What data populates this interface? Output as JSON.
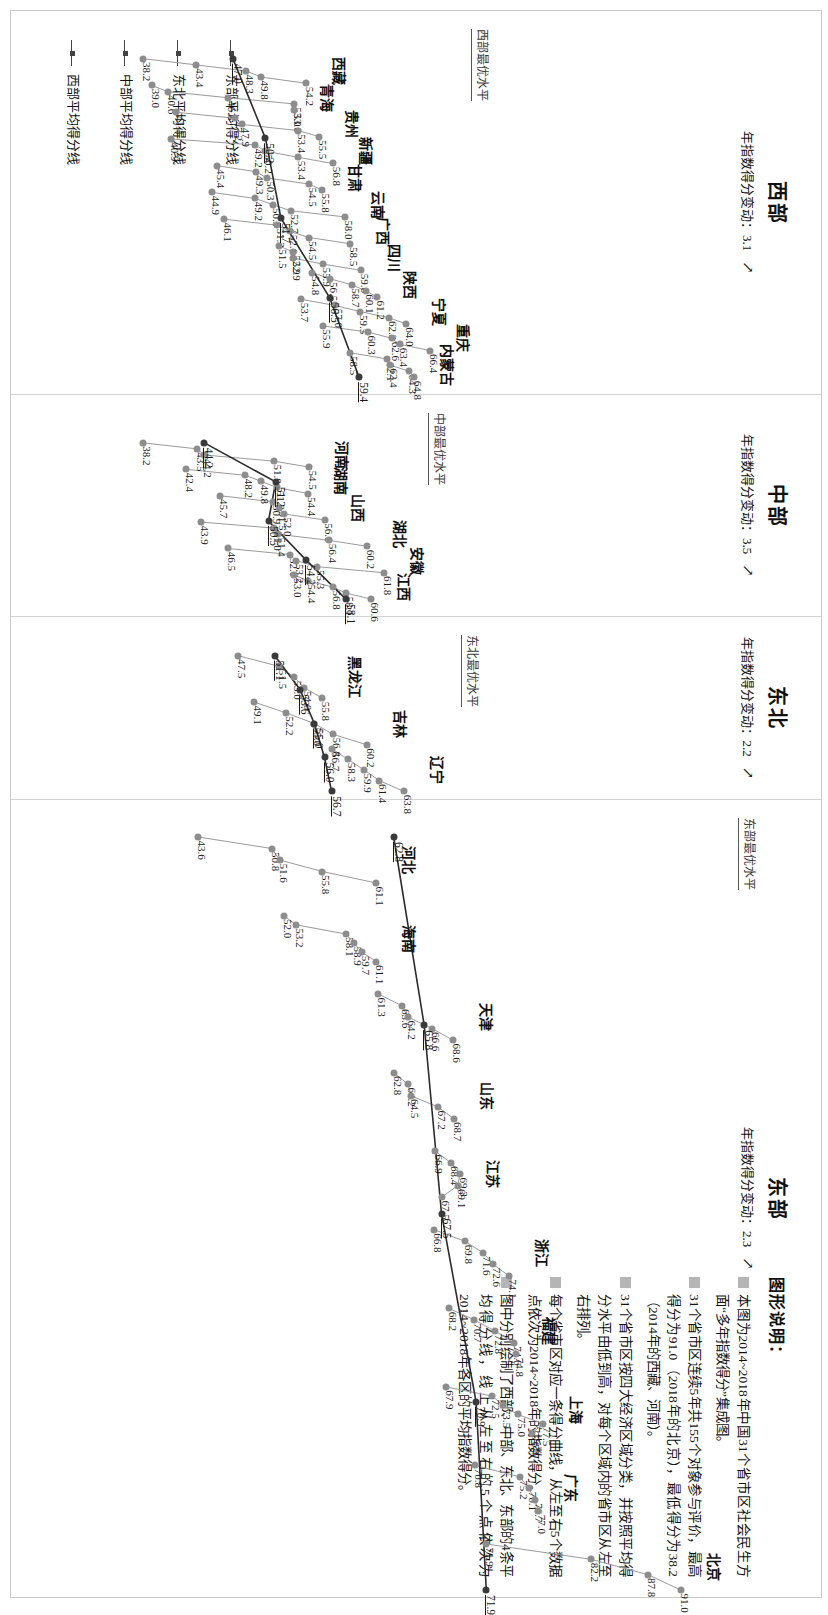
{
  "figure": {
    "orientation": "rotated-90",
    "avg_line_legend": [
      {
        "label": "东部平均得分线"
      },
      {
        "label": "东北平均得分线"
      },
      {
        "label": "中部平均得分线"
      },
      {
        "label": "西部平均得分线"
      }
    ],
    "explanation": {
      "title": "图形说明：",
      "items": [
        "本图为2014~2018年中国31个省市区社会民生方面“多年指数得分”集成图。",
        "31个省市区连续5年共155个对象参与评价，最高得分为91.0（2018年的北京），最低得分为38.2（2014年的西藏、河南）。",
        "31个省市区按四大经济区域分类，并按照平均得分水平由低到高，对每个区域内的省市区从左至右排列。",
        "每个省市区对应一条得分曲线，从左至右5个数据点依次为2014~2018年的指数得分。",
        "图中分别绘制了西部、中部、东北、东部的4条平均得分线，线上从左至右的5个点依次为2014~2018年各区的平均指数得分。"
      ]
    }
  },
  "chart_data": {
    "type": "line",
    "xlabel": "",
    "ylabel": "指数得分",
    "ylim": [
      38,
      92
    ],
    "x": [
      "2014",
      "2015",
      "2016",
      "2017",
      "2018"
    ],
    "grid": false,
    "legend_position": "bottom-left",
    "regions": [
      {
        "name": "西部",
        "annual_change_label": "年指数得分变动：3.1",
        "annual_change": 3.1,
        "best_level_label": "西部最优水平",
        "avg_label": "西部平均得分线",
        "avg_values": [
          47.0,
          50.2,
          51.7,
          56.5,
          59.4
        ],
        "series": [
          {
            "name": "西藏",
            "values": [
              38.2,
              43.4,
              48.3,
              49.8,
              54.2
            ]
          },
          {
            "name": "青海",
            "values": [
              39.0,
              40.6,
              46.5,
              53.0,
              53.0
            ]
          },
          {
            "name": "贵州",
            "values": [
              41.4,
              47.2,
              47.9,
              53.4,
              55.5
            ]
          },
          {
            "name": "新疆",
            "values": [
              40.9,
              49.2,
              50.2,
              53.4,
              56.8
            ]
          },
          {
            "name": "甘肃",
            "values": [
              45.4,
              49.3,
              50.3,
              54.5,
              55.8
            ]
          },
          {
            "name": "云南",
            "values": [
              44.9,
              49.2,
              50.9,
              52.7,
              58.0
            ]
          },
          {
            "name": "广西",
            "values": [
              46.1,
              51.3,
              52.6,
              54.5,
              58.5
            ]
          },
          {
            "name": "四川",
            "values": [
              51.5,
              52.9,
              52.9,
              55.9,
              59.6
            ]
          },
          {
            "name": "陕西",
            "values": [
              54.8,
              56.5,
              58.7,
              60.1,
              61.2
            ]
          },
          {
            "name": "宁夏",
            "values": [
              53.7,
              57.0,
              59.5,
              62.3,
              64.0
            ]
          },
          {
            "name": "重庆",
            "values": [
              55.9,
              60.3,
              62.6,
              63.4,
              66.4
            ]
          },
          {
            "name": "内蒙古",
            "values": [
              58.5,
              62.1,
              62.4,
              64.3,
              64.8
            ]
          }
        ]
      },
      {
        "name": "中部",
        "annual_change_label": "年指数得分变动：3.5",
        "annual_change": 3.5,
        "best_level_label": "中部最优水平",
        "avg_label": "中部平均得分线",
        "avg_values": [
          44.2,
          51.2,
          50.5,
          54.2,
          58.1
        ],
        "series": [
          {
            "name": "河南",
            "values": [
              38.2,
              43.5,
              44.2,
              51.0,
              54.5
            ]
          },
          {
            "name": "湖南",
            "values": [
              42.4,
              48.2,
              49.8,
              51.3,
              54.4
            ]
          },
          {
            "name": "山西",
            "values": [
              45.7,
              50.9,
              51.5,
              52.0,
              56.0
            ]
          },
          {
            "name": "湖北",
            "values": [
              43.9,
              51.0,
              51.4,
              56.4,
              60.2
            ]
          },
          {
            "name": "安徽",
            "values": [
              46.5,
              52.6,
              53.2,
              55.3,
              61.8
            ]
          },
          {
            "name": "江西",
            "values": [
              53.0,
              54.4,
              56.8,
              58.1,
              60.6
            ]
          }
        ]
      },
      {
        "name": "东北",
        "annual_change_label": "年指数得分变动：2.2",
        "annual_change": 2.2,
        "best_level_label": "东北最优水平",
        "avg_label": "东北平均得分线",
        "avg_values": [
          51.1,
          53.6,
          55.0,
          56.0,
          56.7
        ],
        "series": [
          {
            "name": "黑龙江",
            "values": [
              47.5,
              51.5,
              53.0,
              54.0,
              55.8
            ]
          },
          {
            "name": "吉林",
            "values": [
              49.1,
              52.2,
              55.0,
              56.8,
              60.2
            ]
          },
          {
            "name": "辽宁",
            "values": [
              56.7,
              58.3,
              59.9,
              61.4,
              63.8
            ]
          }
        ]
      },
      {
        "name": "东部",
        "annual_change_label": "年指数得分变动：2.3",
        "annual_change": 2.3,
        "best_level_label": "东部最优水平",
        "avg_label": "东部平均得分线",
        "avg_values": [
          62.8,
          65.8,
          67.5,
          70.9,
          71.9
        ],
        "series": [
          {
            "name": "河北",
            "values": [
              43.6,
              50.8,
              51.6,
              55.8,
              61.1
            ]
          },
          {
            "name": "海南",
            "values": [
              52.0,
              53.2,
              58.1,
              58.9,
              59.7,
              61.1
            ]
          },
          {
            "name": "天津",
            "values": [
              61.3,
              63.6,
              64.2,
              66.6,
              68.6
            ]
          },
          {
            "name": "山东",
            "values": [
              62.8,
              64.2,
              64.5,
              67.2,
              68.7
            ]
          },
          {
            "name": "江苏",
            "values": [
              66.9,
              68.4,
              69.3,
              69.1,
              67.5
            ]
          },
          {
            "name": "浙江",
            "values": [
              66.8,
              69.8,
              71.6,
              72.6,
              74.1
            ]
          },
          {
            "name": "福建",
            "values": [
              68.2,
              70.7,
              72.8,
              74.6,
              74.8
            ]
          },
          {
            "name": "上海",
            "values": [
              67.9,
              72.5,
              73.5,
              75.0,
              77.5,
              76.4
            ]
          },
          {
            "name": "广东",
            "values": [
              70.8,
              75.2,
              76.1,
              76.7,
              77.0
            ]
          },
          {
            "name": "北京",
            "values": [
              71.9,
              82.2,
              87.8,
              91.0
            ]
          }
        ]
      }
    ],
    "annotations": {
      "highest": {
        "value": 91.0,
        "who": "2018年的北京"
      },
      "lowest": {
        "value": 38.2,
        "who": "2014年的西藏、河南"
      },
      "total_objects": 155,
      "provinces": 31,
      "years": 5
    }
  }
}
